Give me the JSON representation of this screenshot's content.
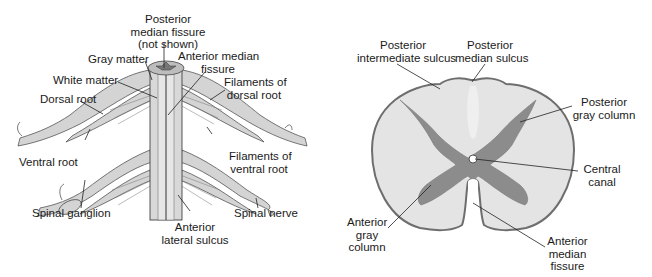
{
  "left_diagram": {
    "title": "Spinal cord with nerve roots (posterior/anterior view)",
    "labels": {
      "posterior_median_fissure": "Posterior\nmedian fissure\n(not shown)",
      "gray_matter": "Gray matter",
      "white_matter": "White matter",
      "dorsal_root": "Dorsal root",
      "ventral_root": "Ventral root",
      "spinal_ganglion": "Spinal ganglion",
      "anterior_median_fissure": "Anterior median\nfissure",
      "filaments_dorsal_root": "Filaments of\ndorsal root",
      "filaments_ventral_root": "Filaments of\nventral root",
      "spinal_nerve": "Spinal nerve",
      "anterior_lateral_sulcus": "Anterior\nlateral sulcus"
    }
  },
  "right_diagram": {
    "title": "Spinal cord cross-section",
    "labels": {
      "posterior_intermediate_sulcus": "Posterior\nintermediate sulcus",
      "posterior_median_sulcus": "Posterior\nmedian sulcus",
      "posterior_gray_column": "Posterior\ngray column",
      "central_canal": "Central\ncanal",
      "anterior_gray_column": "Anterior\ngray\ncolumn",
      "anterior_median_fissure": "Anterior\nmedian\nfissure"
    }
  },
  "colors": {
    "white_matter_fill": "#e4e4e4",
    "gray_matter_fill": "#8c8c8c",
    "outline": "#6e6e6e",
    "leader_line": "#222222",
    "nerve_fill": "#d2d2d2",
    "nerve_stroke": "#555555"
  }
}
